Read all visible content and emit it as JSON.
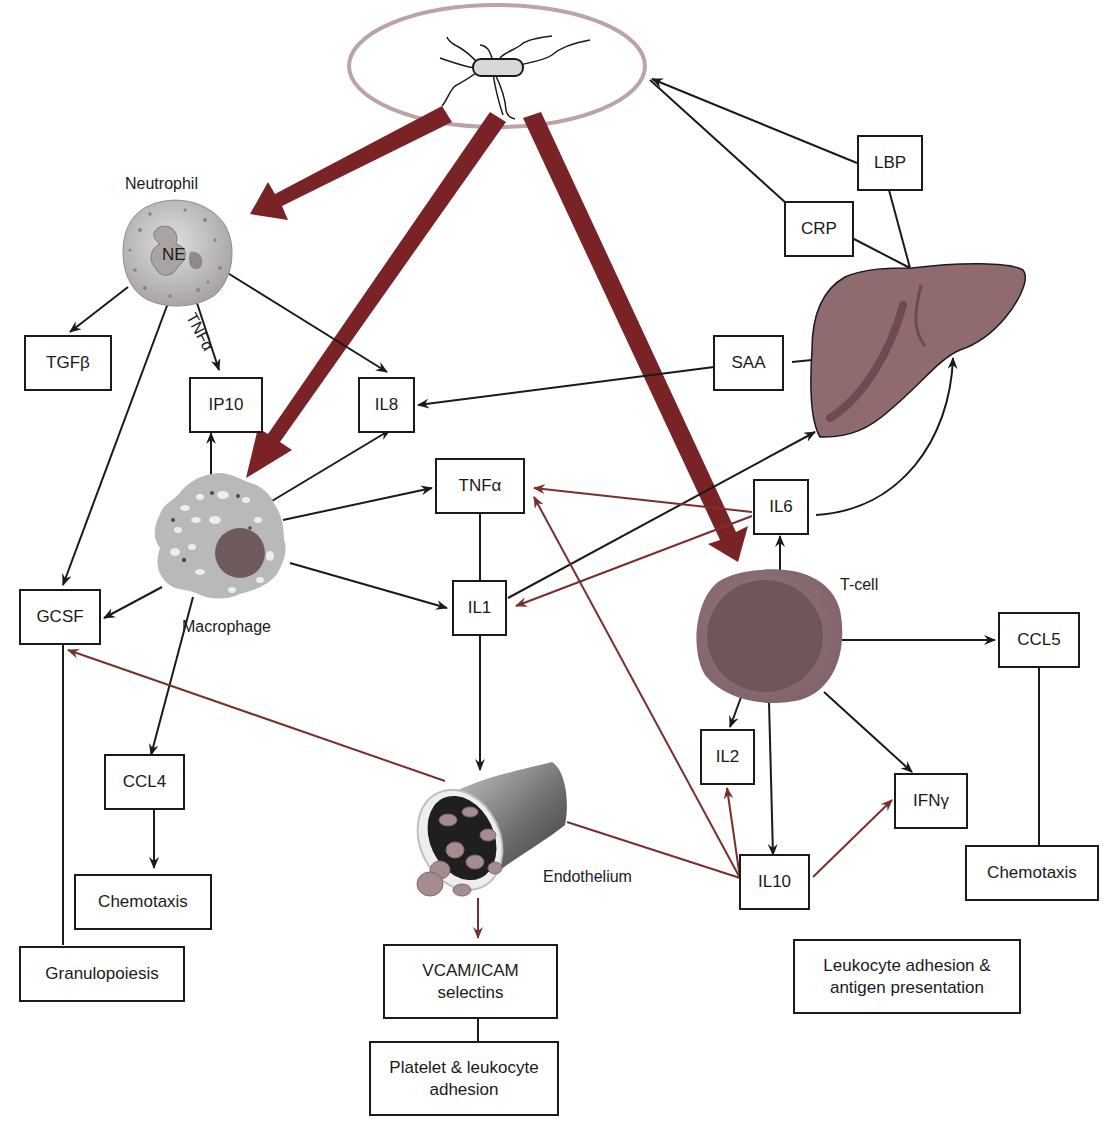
{
  "colors": {
    "thick_arrow": "#7a2327",
    "thin_red": "#7b2e2e",
    "line": "#1a1a1a",
    "ellipse": "#bca3a7",
    "liver": "#8f6a6e",
    "tcell_outer": "#8a6b70",
    "tcell_inner": "#6e565b",
    "macrophage": "#b9b9b9",
    "neutrophil": "#c9c6c6"
  },
  "cells": {
    "pathogen": "bacterium-icon",
    "neutrophil": {
      "label": "Neutrophil",
      "inner": "NE"
    },
    "macrophage": {
      "label": "Macrophage"
    },
    "tcell": {
      "label": "T-cell"
    },
    "endothelium": {
      "label": "Endothelium"
    },
    "liver": "liver-icon"
  },
  "edge_labels": {
    "neutrophil_ip10": "TNFα"
  },
  "boxes": {
    "tgfb": "TGFβ",
    "ip10": "IP10",
    "il8": "IL8",
    "lbp": "LBP",
    "crp": "CRP",
    "saa": "SAA",
    "tnfa": "TNFα",
    "il6": "IL6",
    "il1": "IL1",
    "gcsf": "GCSF",
    "ccl5": "CCL5",
    "ccl4": "CCL4",
    "il2": "IL2",
    "ifng": "IFNγ",
    "il10": "IL10",
    "chemotaxis_left": "Chemotaxis",
    "chemotaxis_right": "Chemotaxis",
    "granulopoiesis": "Granulopoiesis",
    "vcam": "VCAM/ICAM\nselectins",
    "platelet": "Platelet & leukocyte\nadhesion",
    "leukocyte": "Leukocyte adhesion &\nantigen presentation"
  }
}
